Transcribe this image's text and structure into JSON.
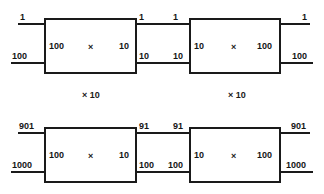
{
  "diagram": {
    "operator_symbol": "×",
    "stage_labels": [
      {
        "text": "× 10"
      },
      {
        "text": "× 10"
      }
    ],
    "boxes": [
      {
        "id": "box-top-left",
        "operator": "×",
        "left_port": "100",
        "right_port": "10",
        "wires": {
          "top_left": "1",
          "bottom_left": "100",
          "top_right": "1",
          "bottom_right": "10"
        }
      },
      {
        "id": "box-top-right",
        "operator": "×",
        "left_port": "10",
        "right_port": "100",
        "wires": {
          "top_left": "1",
          "bottom_left": "10",
          "top_right": "1",
          "bottom_right": "100"
        }
      },
      {
        "id": "box-bottom-left",
        "operator": "×",
        "left_port": "100",
        "right_port": "10",
        "wires": {
          "top_left": "901",
          "bottom_left": "1000",
          "top_right": "91",
          "bottom_right": "100"
        }
      },
      {
        "id": "box-bottom-right",
        "operator": "×",
        "left_port": "10",
        "right_port": "100",
        "wires": {
          "top_left": "91",
          "bottom_left": "100",
          "top_right": "901",
          "bottom_right": "1000"
        }
      }
    ]
  }
}
